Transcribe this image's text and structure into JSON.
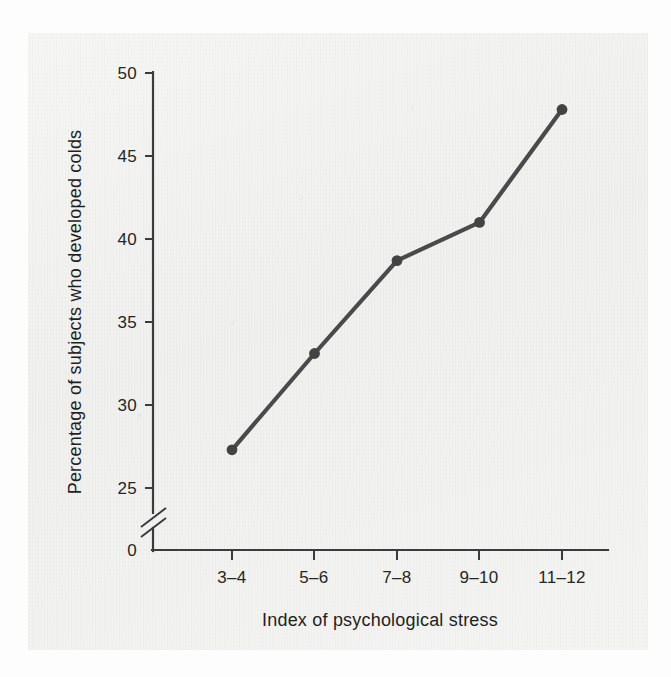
{
  "chart_data": {
    "type": "line",
    "title": "",
    "subtitle": "",
    "xlabel": "Index of psychological stress",
    "ylabel": "Percentage of subjects who developed colds",
    "categories": [
      "3–4",
      "5–6",
      "7–8",
      "9–10",
      "11–12"
    ],
    "values": [
      27.3,
      33.1,
      38.7,
      41.0,
      47.8
    ],
    "series": [
      {
        "name": "Percentage of subjects who developed colds",
        "values": [
          27.3,
          33.1,
          38.7,
          41.0,
          47.8
        ]
      }
    ],
    "y_tick_labels": [
      "0",
      "25",
      "30",
      "35",
      "40",
      "45",
      "50"
    ],
    "y_ticks": [
      0,
      25,
      30,
      35,
      40,
      45,
      50
    ],
    "ylim": [
      25,
      50
    ],
    "y_axis_break": true,
    "y_axis_break_note": "broken axis between 0 and 25",
    "grid": false,
    "legend": false,
    "legend_position": "none",
    "marker": "filled-circle",
    "line_color": "#4a4a4a",
    "marker_color": "#434343",
    "axis_color": "#3b3b3b",
    "background_color": "#efefed"
  },
  "axis": {
    "y_title": "Percentage of subjects who developed colds",
    "x_title": "Index of psychological stress",
    "y_tick_labels": [
      "50",
      "45",
      "40",
      "35",
      "30",
      "25",
      "0"
    ],
    "x_tick_labels": [
      "3–4",
      "5–6",
      "7–8",
      "9–10",
      "11–12"
    ]
  },
  "figure": {
    "caption": ""
  }
}
